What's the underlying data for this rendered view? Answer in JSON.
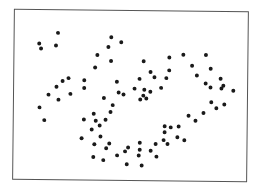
{
  "chart_data": {
    "type": "scatter",
    "title": "",
    "xlabel": "",
    "ylabel": "",
    "xlim": [
      0,
      100
    ],
    "ylim": [
      0,
      100
    ],
    "grid": false,
    "legend": null,
    "axes_visible": false,
    "frame": true,
    "marker_color": "#1a1a1a",
    "marker_radius_px": 2,
    "series": [
      {
        "name": "points",
        "points": [
          {
            "x": 18.6,
            "y": 86.6
          },
          {
            "x": 10.6,
            "y": 80.2
          },
          {
            "x": 11.4,
            "y": 77.3
          },
          {
            "x": 17.8,
            "y": 79.1
          },
          {
            "x": 23.3,
            "y": 59.9
          },
          {
            "x": 20.8,
            "y": 58.1
          },
          {
            "x": 30.1,
            "y": 54.1
          },
          {
            "x": 18.2,
            "y": 54.7
          },
          {
            "x": 24.2,
            "y": 50.6
          },
          {
            "x": 14.8,
            "y": 50.0
          },
          {
            "x": 19.1,
            "y": 47.1
          },
          {
            "x": 11.0,
            "y": 42.4
          },
          {
            "x": 13.1,
            "y": 34.9
          },
          {
            "x": 41.5,
            "y": 84.3
          },
          {
            "x": 45.8,
            "y": 81.4
          },
          {
            "x": 40.3,
            "y": 78.5
          },
          {
            "x": 35.6,
            "y": 73.8
          },
          {
            "x": 41.5,
            "y": 70.3
          },
          {
            "x": 34.7,
            "y": 66.3
          },
          {
            "x": 55.5,
            "y": 70.3
          },
          {
            "x": 30.1,
            "y": 58.7
          },
          {
            "x": 44.1,
            "y": 58.1
          },
          {
            "x": 53.8,
            "y": 59.9
          },
          {
            "x": 51.7,
            "y": 54.1
          },
          {
            "x": 44.9,
            "y": 51.7
          },
          {
            "x": 47.0,
            "y": 50.6
          },
          {
            "x": 38.6,
            "y": 48.3
          },
          {
            "x": 42.4,
            "y": 44.2
          },
          {
            "x": 41.5,
            "y": 40.1
          },
          {
            "x": 34.3,
            "y": 39.0
          },
          {
            "x": 39.4,
            "y": 35.5
          },
          {
            "x": 30.1,
            "y": 35.5
          },
          {
            "x": 35.2,
            "y": 34.9
          },
          {
            "x": 33.5,
            "y": 29.7
          },
          {
            "x": 36.9,
            "y": 32.0
          },
          {
            "x": 29.2,
            "y": 24.4
          },
          {
            "x": 37.3,
            "y": 25.6
          },
          {
            "x": 34.7,
            "y": 20.9
          },
          {
            "x": 41.1,
            "y": 21.5
          },
          {
            "x": 39.8,
            "y": 18.6
          },
          {
            "x": 34.3,
            "y": 13.4
          },
          {
            "x": 38.6,
            "y": 11.6
          },
          {
            "x": 44.5,
            "y": 14.5
          },
          {
            "x": 47.9,
            "y": 16.9
          },
          {
            "x": 49.2,
            "y": 19.2
          },
          {
            "x": 54.2,
            "y": 22.1
          },
          {
            "x": 54.2,
            "y": 18.0
          },
          {
            "x": 53.8,
            "y": 14.5
          },
          {
            "x": 48.7,
            "y": 9.3
          },
          {
            "x": 55.1,
            "y": 8.7
          },
          {
            "x": 58.9,
            "y": 17.4
          },
          {
            "x": 61.0,
            "y": 21.5
          },
          {
            "x": 61.4,
            "y": 14.0
          },
          {
            "x": 66.1,
            "y": 21.5
          },
          {
            "x": 64.8,
            "y": 28.5
          },
          {
            "x": 70.3,
            "y": 25.6
          },
          {
            "x": 64.4,
            "y": 23.8
          },
          {
            "x": 73.3,
            "y": 23.8
          },
          {
            "x": 67.4,
            "y": 31.4
          },
          {
            "x": 70.8,
            "y": 32.0
          },
          {
            "x": 75.0,
            "y": 38.4
          },
          {
            "x": 64.8,
            "y": 32.0
          },
          {
            "x": 81.4,
            "y": 40.1
          },
          {
            "x": 78.0,
            "y": 35.5
          },
          {
            "x": 86.9,
            "y": 43.0
          },
          {
            "x": 90.3,
            "y": 45.3
          },
          {
            "x": 84.7,
            "y": 46.5
          },
          {
            "x": 89.0,
            "y": 54.7
          },
          {
            "x": 94.1,
            "y": 53.5
          },
          {
            "x": 84.3,
            "y": 55.2
          },
          {
            "x": 63.1,
            "y": 54.7
          },
          {
            "x": 65.3,
            "y": 60.5
          },
          {
            "x": 60.2,
            "y": 61.0
          },
          {
            "x": 55.9,
            "y": 53.5
          },
          {
            "x": 58.5,
            "y": 52.3
          },
          {
            "x": 55.5,
            "y": 50.0
          },
          {
            "x": 56.8,
            "y": 48.3
          },
          {
            "x": 54.2,
            "y": 47.7
          },
          {
            "x": 58.5,
            "y": 64.0
          },
          {
            "x": 66.5,
            "y": 72.7
          },
          {
            "x": 72.5,
            "y": 74.4
          },
          {
            "x": 82.2,
            "y": 74.4
          },
          {
            "x": 66.5,
            "y": 65.1
          },
          {
            "x": 76.3,
            "y": 68.0
          },
          {
            "x": 78.4,
            "y": 62.2
          },
          {
            "x": 84.3,
            "y": 66.3
          },
          {
            "x": 82.2,
            "y": 57.6
          },
          {
            "x": 88.6,
            "y": 60.5
          },
          {
            "x": 89.8,
            "y": 56.4
          }
        ]
      }
    ]
  }
}
